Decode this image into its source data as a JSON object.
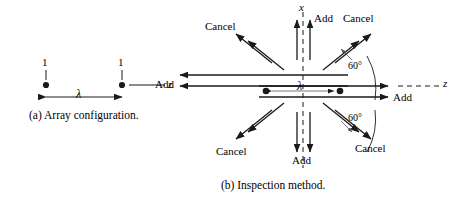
{
  "figure": {
    "type": "technical-diagram",
    "background": "#ffffff",
    "ink_color": "#1a1a1a",
    "panels": [
      {
        "id": "a",
        "caption_prefix": "(a)",
        "caption_text": "Array configuration.",
        "caption_full": "(a) Array configuration.",
        "axis_label": "z",
        "spacing_label": "λ",
        "element_labels": [
          "1",
          "1"
        ],
        "element_count": 2
      },
      {
        "id": "b",
        "caption_prefix": "(b)",
        "caption_text": "Inspection method.",
        "caption_full": "(b) Inspection method.",
        "axis_label_vertical": "x",
        "axis_label_horizontal": "z",
        "spacing_label": "λ",
        "element_count": 2,
        "angle_label": "60°",
        "angle_label_count": 2,
        "directions": [
          {
            "name": "up",
            "label": "Add",
            "angle_deg": 90
          },
          {
            "name": "down",
            "label": "Add",
            "angle_deg": 270
          },
          {
            "name": "left",
            "label": "Add",
            "angle_deg": 180
          },
          {
            "name": "right",
            "label": "Add",
            "angle_deg": 0
          },
          {
            "name": "upper-left",
            "label": "Cancel",
            "angle_deg": 120
          },
          {
            "name": "upper-right",
            "label": "Cancel",
            "angle_deg": 60
          },
          {
            "name": "lower-left",
            "label": "Cancel",
            "angle_deg": 240
          },
          {
            "name": "lower-right",
            "label": "Cancel",
            "angle_deg": 300
          }
        ]
      }
    ]
  },
  "labels": {
    "add": "Add",
    "cancel": "Cancel",
    "lambda": "λ",
    "one": "1",
    "x": "x",
    "z": "z",
    "angle60": "60°",
    "cap_a": "(a) Array configuration.",
    "cap_b": "(b) Inspection method."
  }
}
